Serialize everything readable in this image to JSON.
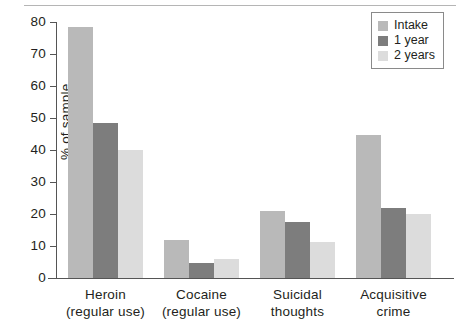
{
  "chart_data": {
    "type": "bar",
    "title": "",
    "xlabel": "",
    "ylabel": "% of sample",
    "ylim": [
      0,
      80
    ],
    "yticks": [
      0,
      10,
      20,
      30,
      40,
      50,
      60,
      70,
      80
    ],
    "grid": false,
    "legend_position": "top-right",
    "categories": [
      "Heroin\n(regular use)",
      "Cocaine\n(regular use)",
      "Suicidal\nthoughts",
      "Acquisitive\ncrime"
    ],
    "category_lines": [
      [
        "Heroin",
        "(regular use)"
      ],
      [
        "Cocaine",
        "(regular use)"
      ],
      [
        "Suicidal",
        "thoughts"
      ],
      [
        "Acquisitive",
        "crime"
      ]
    ],
    "series": [
      {
        "name": "Intake",
        "color": "#b9b9b9",
        "values": [
          78.5,
          11.9,
          21.0,
          44.7
        ]
      },
      {
        "name": "1 year",
        "color": "#7d7d7d",
        "values": [
          48.5,
          4.7,
          17.5,
          22.0
        ]
      },
      {
        "name": "2 years",
        "color": "#dcdcdc",
        "values": [
          40.0,
          6.0,
          11.3,
          20.0
        ]
      }
    ]
  },
  "legend": {
    "items": [
      {
        "label": "Intake",
        "color": "#b9b9b9"
      },
      {
        "label": "1 year",
        "color": "#7d7d7d"
      },
      {
        "label": "2 years",
        "color": "#dcdcdc"
      }
    ]
  },
  "axis": {
    "y_title": "% of sample",
    "y_tick_labels": [
      "0",
      "10",
      "20",
      "30",
      "40",
      "50",
      "60",
      "70",
      "80"
    ]
  }
}
